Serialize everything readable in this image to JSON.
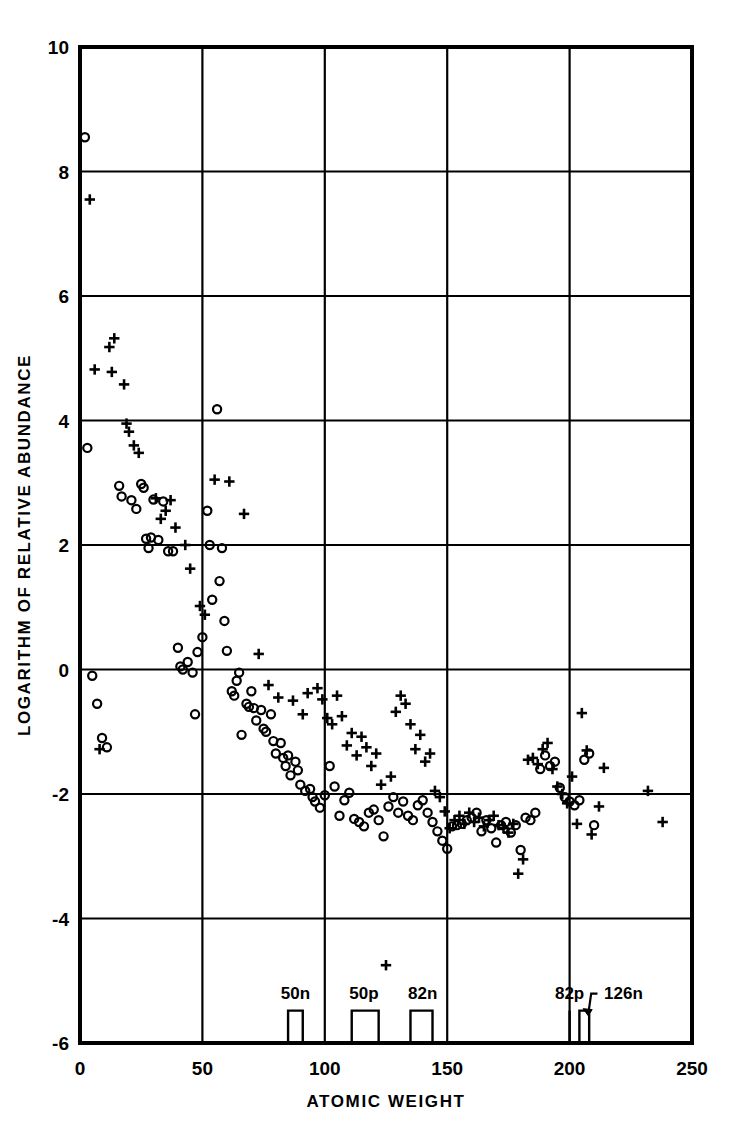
{
  "chart_data": {
    "type": "scatter",
    "title": "",
    "xlabel": "ATOMIC WEIGHT",
    "ylabel": "LOGARITHM OF RELATIVE ABUNDANCE",
    "xlim": [
      0,
      250
    ],
    "ylim": [
      -6,
      10
    ],
    "xticks": [
      0,
      50,
      100,
      150,
      200,
      250
    ],
    "yticks": [
      -6,
      -4,
      -2,
      0,
      2,
      4,
      6,
      8,
      10
    ],
    "xtick_labels": [
      "0",
      "50",
      "100",
      "150",
      "200",
      "250"
    ],
    "ytick_labels": [
      "-6",
      "-4",
      "-2",
      "0",
      "2",
      "4",
      "6",
      "8",
      "10"
    ],
    "grid": true,
    "grid_color": "#000000",
    "legend": null,
    "marker_colors": {
      "circle": "#000000",
      "plus": "#000000"
    },
    "series": [
      {
        "name": "circle",
        "marker": "o",
        "points": [
          [
            2,
            8.55
          ],
          [
            3,
            3.56
          ],
          [
            5,
            -0.1
          ],
          [
            7,
            -0.55
          ],
          [
            9,
            -1.1
          ],
          [
            11,
            -1.25
          ],
          [
            16,
            2.95
          ],
          [
            17,
            2.78
          ],
          [
            21,
            2.72
          ],
          [
            23,
            2.58
          ],
          [
            25,
            2.98
          ],
          [
            26,
            2.92
          ],
          [
            27,
            2.1
          ],
          [
            28,
            1.95
          ],
          [
            29,
            2.12
          ],
          [
            30,
            2.73
          ],
          [
            32,
            2.08
          ],
          [
            34,
            2.7
          ],
          [
            36,
            1.9
          ],
          [
            38,
            1.9
          ],
          [
            40,
            0.35
          ],
          [
            41,
            0.05
          ],
          [
            42,
            0.0
          ],
          [
            44,
            0.12
          ],
          [
            46,
            -0.05
          ],
          [
            47,
            -0.72
          ],
          [
            48,
            0.28
          ],
          [
            50,
            0.52
          ],
          [
            52,
            2.55
          ],
          [
            53,
            2.0
          ],
          [
            54,
            1.12
          ],
          [
            56,
            4.18
          ],
          [
            57,
            1.42
          ],
          [
            58,
            1.95
          ],
          [
            59,
            0.78
          ],
          [
            60,
            0.3
          ],
          [
            62,
            -0.35
          ],
          [
            63,
            -0.42
          ],
          [
            64,
            -0.18
          ],
          [
            65,
            -0.05
          ],
          [
            66,
            -1.05
          ],
          [
            68,
            -0.55
          ],
          [
            69,
            -0.6
          ],
          [
            70,
            -0.35
          ],
          [
            71,
            -0.62
          ],
          [
            72,
            -0.82
          ],
          [
            74,
            -0.65
          ],
          [
            75,
            -0.95
          ],
          [
            76,
            -1.0
          ],
          [
            78,
            -0.72
          ],
          [
            79,
            -1.15
          ],
          [
            80,
            -1.35
          ],
          [
            82,
            -1.18
          ],
          [
            83,
            -1.42
          ],
          [
            84,
            -1.55
          ],
          [
            85,
            -1.38
          ],
          [
            86,
            -1.7
          ],
          [
            88,
            -1.48
          ],
          [
            89,
            -1.62
          ],
          [
            90,
            -1.85
          ],
          [
            92,
            -1.95
          ],
          [
            94,
            -1.92
          ],
          [
            95,
            -2.05
          ],
          [
            96,
            -2.12
          ],
          [
            98,
            -2.22
          ],
          [
            100,
            -2.02
          ],
          [
            102,
            -1.55
          ],
          [
            104,
            -1.88
          ],
          [
            106,
            -2.35
          ],
          [
            108,
            -2.1
          ],
          [
            110,
            -1.98
          ],
          [
            112,
            -2.4
          ],
          [
            114,
            -2.45
          ],
          [
            116,
            -2.52
          ],
          [
            118,
            -2.3
          ],
          [
            120,
            -2.25
          ],
          [
            122,
            -2.42
          ],
          [
            124,
            -2.68
          ],
          [
            126,
            -2.2
          ],
          [
            128,
            -2.05
          ],
          [
            130,
            -2.3
          ],
          [
            132,
            -2.12
          ],
          [
            134,
            -2.35
          ],
          [
            136,
            -2.42
          ],
          [
            138,
            -2.18
          ],
          [
            140,
            -2.1
          ],
          [
            142,
            -2.3
          ],
          [
            144,
            -2.45
          ],
          [
            146,
            -2.6
          ],
          [
            148,
            -2.75
          ],
          [
            150,
            -2.88
          ],
          [
            152,
            -2.52
          ],
          [
            154,
            -2.5
          ],
          [
            156,
            -2.48
          ],
          [
            158,
            -2.42
          ],
          [
            160,
            -2.38
          ],
          [
            162,
            -2.3
          ],
          [
            164,
            -2.6
          ],
          [
            166,
            -2.42
          ],
          [
            168,
            -2.55
          ],
          [
            170,
            -2.78
          ],
          [
            172,
            -2.5
          ],
          [
            174,
            -2.45
          ],
          [
            176,
            -2.62
          ],
          [
            178,
            -2.5
          ],
          [
            180,
            -2.9
          ],
          [
            182,
            -2.38
          ],
          [
            184,
            -2.42
          ],
          [
            186,
            -2.3
          ],
          [
            188,
            -1.6
          ],
          [
            190,
            -1.38
          ],
          [
            192,
            -1.55
          ],
          [
            194,
            -1.48
          ],
          [
            196,
            -1.9
          ],
          [
            198,
            -2.05
          ],
          [
            200,
            -2.12
          ],
          [
            202,
            -2.18
          ],
          [
            204,
            -2.1
          ],
          [
            206,
            -1.45
          ],
          [
            208,
            -1.35
          ],
          [
            210,
            -2.5
          ]
        ]
      },
      {
        "name": "plus",
        "marker": "+",
        "points": [
          [
            4,
            7.55
          ],
          [
            6,
            4.82
          ],
          [
            8,
            -1.28
          ],
          [
            12,
            5.18
          ],
          [
            13,
            4.78
          ],
          [
            14,
            5.32
          ],
          [
            18,
            4.58
          ],
          [
            19,
            3.95
          ],
          [
            20,
            3.82
          ],
          [
            22,
            3.6
          ],
          [
            24,
            3.48
          ],
          [
            31,
            2.75
          ],
          [
            33,
            2.42
          ],
          [
            35,
            2.55
          ],
          [
            37,
            2.72
          ],
          [
            39,
            2.28
          ],
          [
            43,
            2.0
          ],
          [
            45,
            1.62
          ],
          [
            49,
            1.02
          ],
          [
            51,
            0.88
          ],
          [
            55,
            3.05
          ],
          [
            61,
            3.02
          ],
          [
            67,
            2.5
          ],
          [
            73,
            0.25
          ],
          [
            77,
            -0.25
          ],
          [
            81,
            -0.45
          ],
          [
            87,
            -0.5
          ],
          [
            91,
            -0.72
          ],
          [
            93,
            -0.38
          ],
          [
            97,
            -0.3
          ],
          [
            99,
            -0.48
          ],
          [
            101,
            -0.78
          ],
          [
            103,
            -0.88
          ],
          [
            105,
            -0.42
          ],
          [
            107,
            -0.75
          ],
          [
            109,
            -1.22
          ],
          [
            111,
            -1.02
          ],
          [
            113,
            -1.38
          ],
          [
            115,
            -1.08
          ],
          [
            117,
            -1.25
          ],
          [
            119,
            -1.55
          ],
          [
            121,
            -1.35
          ],
          [
            123,
            -1.85
          ],
          [
            125,
            -4.75
          ],
          [
            127,
            -1.72
          ],
          [
            129,
            -0.68
          ],
          [
            131,
            -0.42
          ],
          [
            133,
            -0.55
          ],
          [
            135,
            -0.88
          ],
          [
            137,
            -1.28
          ],
          [
            139,
            -1.05
          ],
          [
            141,
            -1.48
          ],
          [
            143,
            -1.35
          ],
          [
            145,
            -1.95
          ],
          [
            147,
            -2.05
          ],
          [
            149,
            -2.28
          ],
          [
            151,
            -2.55
          ],
          [
            153,
            -2.42
          ],
          [
            155,
            -2.35
          ],
          [
            157,
            -2.48
          ],
          [
            159,
            -2.3
          ],
          [
            161,
            -2.45
          ],
          [
            163,
            -2.38
          ],
          [
            165,
            -2.52
          ],
          [
            167,
            -2.42
          ],
          [
            169,
            -2.35
          ],
          [
            171,
            -2.5
          ],
          [
            173,
            -2.55
          ],
          [
            175,
            -2.62
          ],
          [
            177,
            -2.48
          ],
          [
            179,
            -3.28
          ],
          [
            181,
            -3.05
          ],
          [
            183,
            -1.45
          ],
          [
            185,
            -1.42
          ],
          [
            187,
            -1.52
          ],
          [
            189,
            -1.28
          ],
          [
            191,
            -1.18
          ],
          [
            193,
            -1.6
          ],
          [
            195,
            -1.88
          ],
          [
            197,
            -2.0
          ],
          [
            199,
            -2.15
          ],
          [
            201,
            -1.72
          ],
          [
            203,
            -2.48
          ],
          [
            205,
            -0.7
          ],
          [
            207,
            -1.3
          ],
          [
            209,
            -2.65
          ],
          [
            232,
            -1.95
          ],
          [
            238,
            -2.45
          ],
          [
            212,
            -2.2
          ],
          [
            214,
            -1.58
          ]
        ]
      }
    ],
    "magic_numbers": [
      {
        "label": "50n",
        "a_start": 85,
        "a_end": 91,
        "height": 0.52,
        "label_a": 88,
        "kind": "box"
      },
      {
        "label": "50p",
        "a_start": 111,
        "a_end": 122,
        "height": 0.52,
        "label_a": 116,
        "kind": "box"
      },
      {
        "label": "82n",
        "a_start": 135,
        "a_end": 144,
        "height": 0.52,
        "label_a": 140,
        "kind": "box"
      },
      {
        "label": "82p",
        "a_start": 200,
        "a_end": 201,
        "height": 0.52,
        "label_a": 200,
        "kind": "line"
      },
      {
        "label": "126n",
        "a_start": 204,
        "a_end": 208,
        "height": 0.52,
        "label_a": 222,
        "kind": "box"
      }
    ]
  }
}
